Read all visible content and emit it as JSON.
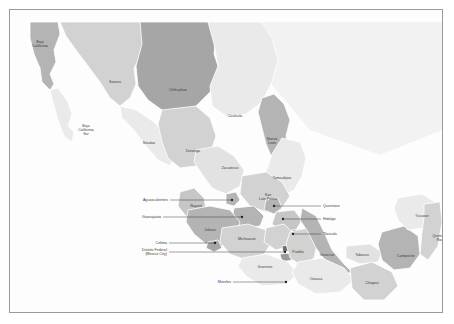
{
  "map": {
    "title": "Mexico states reference map",
    "frame_border_color": "#9a9a9a",
    "background_color": "#fdfdfd",
    "sea_color": "#f2f2f2",
    "label_color": "#3a3a3a",
    "leader_color": "#2e2e2e",
    "palette": {
      "light": "#eaeaea",
      "light2": "#e2e2e2",
      "mid": "#d2d2d2",
      "mid2": "#c6c6c6",
      "dark": "#b4b4b4",
      "darker": "#a6a6a6"
    },
    "states": [
      {
        "name": "Baja California",
        "label_x": 30,
        "label_y": 34,
        "shade": "dark",
        "multiline": [
          "Baja",
          "California"
        ]
      },
      {
        "name": "Baja California Sur",
        "label_x": 76,
        "label_y": 120,
        "shade": "light",
        "multiline": [
          "Baja",
          "California",
          "Sur"
        ]
      },
      {
        "name": "Sonora",
        "label_x": 105,
        "label_y": 72,
        "shade": "mid",
        "multiline": [
          "Sonora"
        ]
      },
      {
        "name": "Chihuahua",
        "label_x": 168,
        "label_y": 80,
        "shade": "darker",
        "multiline": [
          "Chihuahua"
        ]
      },
      {
        "name": "Coahuila",
        "label_x": 225,
        "label_y": 106,
        "shade": "light",
        "multiline": [
          "Coahuila"
        ]
      },
      {
        "name": "Nuevo Leon",
        "label_x": 262,
        "label_y": 131,
        "shade": "dark",
        "multiline": [
          "Nuevo",
          "Leon"
        ]
      },
      {
        "name": "Sinaloa",
        "label_x": 139,
        "label_y": 133,
        "shade": "light",
        "multiline": [
          "Sinaloa"
        ]
      },
      {
        "name": "Durango",
        "label_x": 183,
        "label_y": 141,
        "shade": "mid",
        "multiline": [
          "Durango"
        ]
      },
      {
        "name": "Zacatecas",
        "label_x": 220,
        "label_y": 158,
        "shade": "light2",
        "multiline": [
          "Zacatecas"
        ]
      },
      {
        "name": "Tamaulipas",
        "label_x": 272,
        "label_y": 168,
        "shade": "light",
        "multiline": [
          "Tamaulipas"
        ]
      },
      {
        "name": "San Luis Potosi",
        "label_x": 258,
        "label_y": 187,
        "shade": "mid",
        "multiline": [
          "San",
          "Luis Potosi"
        ]
      },
      {
        "name": "Nayarit",
        "label_x": 186,
        "label_y": 196,
        "shade": "mid2",
        "multiline": [
          "Nayarit"
        ]
      },
      {
        "name": "Jalisco",
        "label_x": 200,
        "label_y": 220,
        "shade": "dark",
        "multiline": [
          "Jalisco"
        ]
      },
      {
        "name": "Michoacan",
        "label_x": 237,
        "label_y": 229,
        "shade": "mid",
        "multiline": [
          "Michoacan"
        ]
      },
      {
        "name": "Guerrero",
        "label_x": 255,
        "label_y": 257,
        "shade": "light",
        "multiline": [
          "Guerrero"
        ]
      },
      {
        "name": "Puebla",
        "label_x": 288,
        "label_y": 242,
        "shade": "mid",
        "multiline": [
          "Puebla"
        ]
      },
      {
        "name": "Veracruz",
        "label_x": 317,
        "label_y": 245,
        "shade": "dark",
        "multiline": [
          "Veracruz"
        ]
      },
      {
        "name": "Oaxaca",
        "label_x": 306,
        "label_y": 269,
        "shade": "light",
        "multiline": [
          "Oaxaca"
        ]
      },
      {
        "name": "Tabasco",
        "label_x": 352,
        "label_y": 245,
        "shade": "light2",
        "multiline": [
          "Tabasco"
        ]
      },
      {
        "name": "Chiapas",
        "label_x": 362,
        "label_y": 273,
        "shade": "mid",
        "multiline": [
          "Chiapas"
        ]
      },
      {
        "name": "Campeche",
        "label_x": 396,
        "label_y": 246,
        "shade": "dark",
        "multiline": [
          "Campeche"
        ]
      },
      {
        "name": "Yucatan",
        "label_x": 412,
        "label_y": 206,
        "shade": "light",
        "multiline": [
          "Yucatan"
        ]
      },
      {
        "name": "Quintana Roo",
        "label_x": 430,
        "label_y": 228,
        "shade": "mid",
        "multiline": [
          "Quintana",
          "Roo"
        ]
      }
    ],
    "callouts": [
      {
        "name": "Aguascalientes",
        "label": [
          "Aguascalientes"
        ],
        "label_x": 158,
        "label_y": 190,
        "dot_x": 222,
        "dot_y": 190,
        "side": "left"
      },
      {
        "name": "Guanajuato",
        "label": [
          "Guanajuato"
        ],
        "label_x": 151,
        "label_y": 207,
        "dot_x": 232,
        "dot_y": 207,
        "side": "left"
      },
      {
        "name": "Colima",
        "label": [
          "Colima"
        ],
        "label_x": 157,
        "label_y": 233,
        "dot_x": 205,
        "dot_y": 233,
        "side": "left"
      },
      {
        "name": "Distrito Federal",
        "label": [
          "Distrito Federal",
          "(Mexico City)"
        ],
        "label_x": 157,
        "label_y": 242,
        "dot_x": 275,
        "dot_y": 242,
        "side": "left"
      },
      {
        "name": "Morelos",
        "label": [
          "Morelos"
        ],
        "label_x": 221,
        "label_y": 272,
        "dot_x": 276,
        "dot_y": 272,
        "side": "left"
      },
      {
        "name": "Queretaro",
        "label": [
          "Queretaro"
        ],
        "label_x": 313,
        "label_y": 196,
        "dot_x": 264,
        "dot_y": 196,
        "side": "right"
      },
      {
        "name": "Hidalgo",
        "label": [
          "Hidalgo"
        ],
        "label_x": 313,
        "label_y": 209,
        "dot_x": 273,
        "dot_y": 209,
        "side": "right"
      },
      {
        "name": "Tlaxcala",
        "label": [
          "Tlaxcala"
        ],
        "label_x": 313,
        "label_y": 224,
        "dot_x": 283,
        "dot_y": 224,
        "side": "right"
      }
    ]
  }
}
